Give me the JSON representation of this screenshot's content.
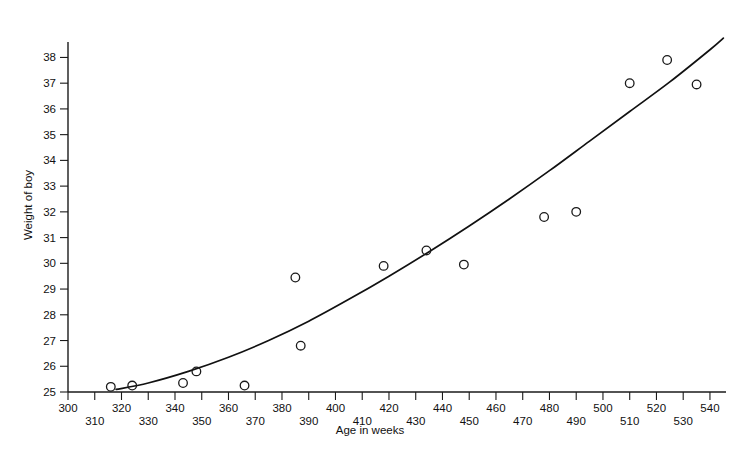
{
  "chart_data": {
    "type": "scatter",
    "title": "",
    "xlabel": "Age in weeks",
    "ylabel": "Weight of boy",
    "xlim": [
      300,
      546
    ],
    "ylim": [
      25,
      38.6
    ],
    "grid": false,
    "legend": "none",
    "x_ticks": [
      300,
      310,
      320,
      330,
      340,
      350,
      360,
      370,
      380,
      390,
      400,
      410,
      420,
      430,
      440,
      450,
      460,
      470,
      480,
      490,
      500,
      510,
      520,
      530,
      540
    ],
    "x_tick_labels": [
      "300",
      "310",
      "320",
      "330",
      "340",
      "350",
      "360",
      "370",
      "380",
      "390",
      "400",
      "410",
      "420",
      "430",
      "440",
      "450",
      "460",
      "470",
      "480",
      "490",
      "500",
      "510",
      "520",
      "530",
      "540"
    ],
    "y_ticks": [
      25,
      26,
      27,
      28,
      29,
      30,
      31,
      32,
      33,
      34,
      35,
      36,
      37,
      38
    ],
    "y_tick_labels": [
      "25",
      "26",
      "27",
      "28",
      "29",
      "30",
      "31",
      "32",
      "33",
      "34",
      "35",
      "36",
      "37",
      "38"
    ],
    "points": [
      {
        "x": 316,
        "y": 25.2
      },
      {
        "x": 324,
        "y": 25.25
      },
      {
        "x": 343,
        "y": 25.35
      },
      {
        "x": 348,
        "y": 25.8
      },
      {
        "x": 366,
        "y": 25.25
      },
      {
        "x": 385,
        "y": 29.45
      },
      {
        "x": 387,
        "y": 26.8
      },
      {
        "x": 418,
        "y": 29.9
      },
      {
        "x": 434,
        "y": 30.5
      },
      {
        "x": 448,
        "y": 29.95
      },
      {
        "x": 478,
        "y": 31.8
      },
      {
        "x": 490,
        "y": 32.0
      },
      {
        "x": 510,
        "y": 37.0
      },
      {
        "x": 524,
        "y": 37.9
      },
      {
        "x": 535,
        "y": 36.95
      }
    ],
    "series": [
      {
        "name": "fitted curve",
        "type": "line",
        "x": [
          318,
          330,
          345,
          360,
          375,
          390,
          405,
          420,
          435,
          450,
          465,
          480,
          495,
          510,
          525,
          540,
          545
        ],
        "y": [
          25.1,
          25.35,
          25.8,
          26.35,
          27.0,
          27.75,
          28.6,
          29.5,
          30.45,
          31.45,
          32.5,
          33.6,
          34.75,
          35.9,
          37.05,
          38.3,
          38.75
        ]
      }
    ]
  }
}
